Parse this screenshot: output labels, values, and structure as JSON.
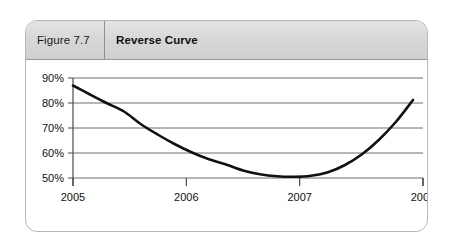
{
  "figure": {
    "number": "Figure 7.7",
    "title": "Reverse Curve"
  },
  "chart_data": {
    "type": "line",
    "title": "Reverse Curve",
    "xlabel": "",
    "ylabel": "",
    "x_tick_labels": [
      "2005",
      "2006",
      "2007",
      "2008"
    ],
    "y_tick_labels": [
      "50%",
      "60%",
      "70%",
      "80%",
      "90%"
    ],
    "xlim": [
      2005,
      2008
    ],
    "ylim": [
      50,
      90
    ],
    "grid": true,
    "legend": false,
    "series": [
      {
        "name": "Reverse Curve",
        "x": [
          2005.0,
          2005.15,
          2005.3,
          2005.45,
          2005.6,
          2005.75,
          2005.9,
          2006.05,
          2006.2,
          2006.35,
          2006.5,
          2006.65,
          2006.8,
          2006.95,
          2007.1,
          2007.25,
          2007.4,
          2007.55,
          2007.7,
          2007.85,
          2008.0
        ],
        "values": [
          87.0,
          83.4,
          79.9,
          76.6,
          71.5,
          67.3,
          63.5,
          60.2,
          57.5,
          55.4,
          53.0,
          51.5,
          50.7,
          50.5,
          50.9,
          52.3,
          55.2,
          59.5,
          65.3,
          72.5,
          81.2
        ]
      }
    ],
    "annotations": []
  },
  "colors": {
    "curve": "#111111",
    "gridline": "#6e6e6e",
    "axis": "#4a4a4a",
    "header_background": "#d9d9d9",
    "panel_border": "#b8b8b8"
  }
}
